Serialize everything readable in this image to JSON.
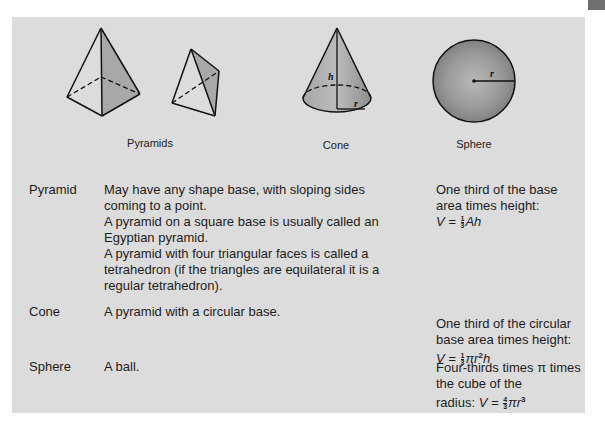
{
  "colors": {
    "panel_background": "#dcdcdc",
    "page_background": "#ffffff",
    "corner_tab": "#6f6f6f",
    "shading": "#9a9a9a"
  },
  "figures": {
    "pyramids_caption": "Pyramids",
    "cone_caption": "Cone",
    "sphere_caption": "Sphere",
    "cone_height_label": "h",
    "cone_radius_label": "r",
    "sphere_radius_label": "r"
  },
  "rows": [
    {
      "term": "Pyramid",
      "description": [
        "May have any shape base, with sloping sides coming to a point.",
        "A pyramid on a square base is usually called an Egyptian pyramid.",
        "A pyramid with four triangular faces is called a tetrahedron (if the triangles are equilateral it is a regular tetrahedron)."
      ],
      "formula_text": "One third of the base area times height:",
      "formula": {
        "lhs": "V =",
        "frac_num": "1",
        "frac_den": "3",
        "rest": "Ah",
        "sup": ""
      }
    },
    {
      "term": "Cone",
      "description": [
        "A pyramid with a circular base."
      ],
      "formula_text": "One third of the circular base area times height:",
      "formula": {
        "lhs": "V =",
        "frac_num": "1",
        "frac_den": "3",
        "rest_pre": "πr",
        "sup": "2",
        "rest_post": "h"
      }
    },
    {
      "term": "Sphere",
      "description": [
        "A ball."
      ],
      "formula_text_1": "Four-thirds times π times the cube of the",
      "formula_text_2": "radius:",
      "formula": {
        "lhs": "V =",
        "frac_num": "4",
        "frac_den": "3",
        "rest_pre": "πr",
        "sup": "3"
      }
    }
  ]
}
